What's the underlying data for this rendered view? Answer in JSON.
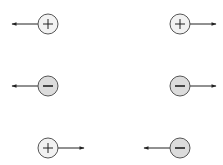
{
  "diagram": {
    "colors": {
      "stroke": "#555555",
      "arrow": "#222222",
      "positive_fill": "#f2f2f2",
      "negative_fill": "#dcdcdc"
    },
    "charges": [
      {
        "id": "c1",
        "sign": "+",
        "cx": 48,
        "cy": 24,
        "arrow": "left"
      },
      {
        "id": "c2",
        "sign": "+",
        "cx": 180,
        "cy": 24,
        "arrow": "right"
      },
      {
        "id": "c3",
        "sign": "-",
        "cx": 48,
        "cy": 86,
        "arrow": "left"
      },
      {
        "id": "c4",
        "sign": "-",
        "cx": 180,
        "cy": 86,
        "arrow": "right"
      },
      {
        "id": "c5",
        "sign": "+",
        "cx": 48,
        "cy": 148,
        "arrow": "right"
      },
      {
        "id": "c6",
        "sign": "-",
        "cx": 180,
        "cy": 148,
        "arrow": "left"
      }
    ],
    "radius": 10,
    "arrow_length": 26
  }
}
